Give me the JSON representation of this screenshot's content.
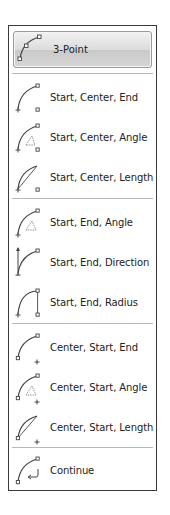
{
  "panel": {
    "featured": {
      "label": "3-Point",
      "icon": "arc-3point-icon"
    },
    "groups": [
      {
        "items": [
          {
            "label": "Start, Center, End",
            "icon": "arc-start-center-end-icon"
          },
          {
            "label": "Start, Center, Angle",
            "icon": "arc-start-center-angle-icon"
          },
          {
            "label": "Start, Center, Length",
            "icon": "arc-start-center-length-icon"
          }
        ]
      },
      {
        "items": [
          {
            "label": "Start, End, Angle",
            "icon": "arc-start-end-angle-icon"
          },
          {
            "label": "Start, End, Direction",
            "icon": "arc-start-end-direction-icon"
          },
          {
            "label": "Start, End, Radius",
            "icon": "arc-start-end-radius-icon"
          }
        ]
      },
      {
        "items": [
          {
            "label": "Center, Start, End",
            "icon": "arc-center-start-end-icon"
          },
          {
            "label": "Center, Start, Angle",
            "icon": "arc-center-start-angle-icon"
          },
          {
            "label": "Center, Start, Length",
            "icon": "arc-center-start-length-icon"
          }
        ]
      },
      {
        "items": [
          {
            "label": "Continue",
            "icon": "arc-continue-icon"
          }
        ]
      }
    ]
  }
}
